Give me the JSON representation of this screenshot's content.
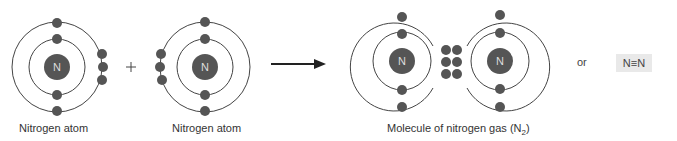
{
  "diagram": {
    "atom_left": {
      "label": "Nitrogen atom",
      "nucleus_symbol": "N"
    },
    "plus_sign": "+",
    "atom_right": {
      "label": "Nitrogen atom",
      "nucleus_symbol": "N"
    },
    "arrow": "reaction-arrow",
    "molecule": {
      "label_prefix": "Molecule of nitrogen gas (N",
      "label_subscript": "2",
      "label_suffix": ")",
      "nucleus_left": "N",
      "nucleus_right": "N",
      "shared_electron_pairs": 3
    },
    "or_text": "or",
    "formula": "N≡N",
    "colors": {
      "electron": "#555555",
      "nucleus": "#555555",
      "nucleus_text": "#dddddd",
      "orbit": "#444444",
      "formula_bg": "#e9e9e9"
    }
  }
}
